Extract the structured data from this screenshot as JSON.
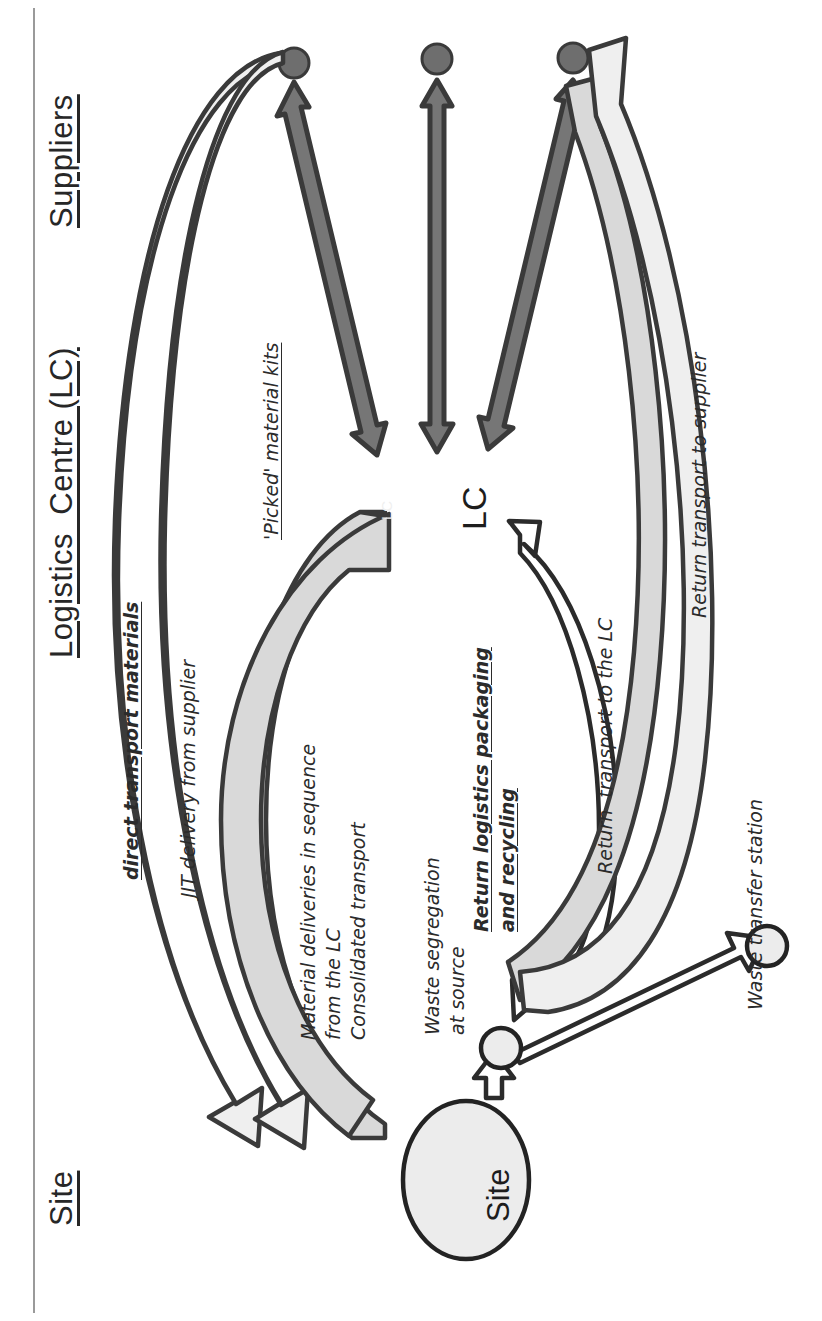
{
  "diagram": {
    "type": "flow-diagram",
    "colors": {
      "ink": "#272727",
      "dark_arrow_fill": "#767676",
      "dark_arrow_stroke": "#3a3a3a",
      "mid_arrow_fill": "#9e9e9e",
      "light_arrow_fill": "#d4d4d4",
      "pale_arrow_fill": "#ededed",
      "white_arrow_fill": "#ffffff",
      "node_fill": "#ececec",
      "supplier_dot_fill": "#6e6e6e",
      "watermark": "#efefef"
    }
  },
  "columns": [
    {
      "id": "suppliers",
      "label": "Suppliers"
    },
    {
      "id": "logistics-centre",
      "label": "Logistics  Centre (LC)"
    },
    {
      "id": "site",
      "label": "Site"
    }
  ],
  "nodes": [
    {
      "id": "lc",
      "label": "LC",
      "shape": "text"
    },
    {
      "id": "site",
      "label": "Site",
      "shape": "ellipse"
    },
    {
      "id": "supplier-1",
      "label": "",
      "shape": "dot"
    },
    {
      "id": "supplier-2",
      "label": "",
      "shape": "dot"
    },
    {
      "id": "supplier-3",
      "label": "",
      "shape": "dot"
    },
    {
      "id": "waste-segregation-point",
      "label": "",
      "shape": "small-circle"
    },
    {
      "id": "waste-transfer-station-point",
      "label": "",
      "shape": "small-circle"
    }
  ],
  "watermark": {
    "text": "LC"
  },
  "flows": [
    {
      "id": "direct-transport-materials",
      "label": "direct transport materials",
      "style": "bold-italic-underline"
    },
    {
      "id": "jit-delivery-from-supplier",
      "label": "JIT delivery from supplier",
      "style": "italic"
    },
    {
      "id": "picked-material-kits",
      "label": "'Picked' material kits",
      "style": "italic-underline"
    },
    {
      "id": "material-deliveries-in-sequence",
      "label": "Material deliveries in sequence",
      "style": "italic"
    },
    {
      "id": "from-the-lc",
      "label": "from the LC",
      "style": "italic"
    },
    {
      "id": "consolidated-transport",
      "label": "Consolidated transport",
      "style": "italic"
    },
    {
      "id": "waste-segregation-at-source",
      "label": "Waste segregation",
      "style": "italic"
    },
    {
      "id": "at-source",
      "label": "at source",
      "style": "italic"
    },
    {
      "id": "return-logistics-packaging",
      "label": "Return logistics packaging",
      "style": "bold-italic-underline"
    },
    {
      "id": "and-recycling",
      "label": "and recycling",
      "style": "bold-italic-underline"
    },
    {
      "id": "return-transport-to-the-lc",
      "label": "Return  transport to the LC",
      "style": "italic"
    },
    {
      "id": "return-transport-to-supplier",
      "label": "Return transport to supplier",
      "style": "italic"
    },
    {
      "id": "waste-transfer-station",
      "label": "Waste transfer station",
      "style": "italic"
    }
  ]
}
